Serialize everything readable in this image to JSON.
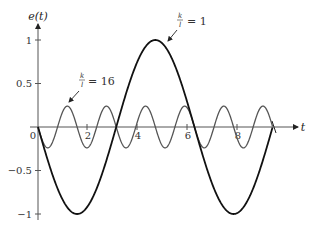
{
  "chart_data": {
    "type": "line",
    "title": "",
    "xlabel": "t",
    "ylabel": "e(t)",
    "xlim": [
      0,
      9.42
    ],
    "ylim": [
      -1.05,
      1.1
    ],
    "x_ticks": [
      0,
      2,
      4,
      6,
      8
    ],
    "x_tick_labels": [
      "0",
      "2",
      "4",
      "6",
      "8"
    ],
    "y_ticks": [
      1,
      0.5,
      -0.5,
      -1
    ],
    "y_tick_labels": [
      "1",
      "0.5",
      "−0.5",
      "−1"
    ],
    "grid": false,
    "legend": "none (inline annotations with arrows)",
    "series": [
      {
        "name": "k/l = 1",
        "formula": "e(t) = -sin(t)",
        "amplitude": 1.0,
        "period": 6.283,
        "color": "#111111",
        "x": [
          0,
          1.571,
          3.142,
          4.712,
          6.283,
          7.854,
          9.425
        ],
        "values": [
          0,
          -1,
          0,
          1,
          0,
          -1,
          0
        ]
      },
      {
        "name": "k/l = 16",
        "formula": "e(t) = -0.24 sin(4t)",
        "amplitude": 0.24,
        "period": 1.571,
        "color": "#555555",
        "x": [
          0,
          0.393,
          0.785,
          1.178,
          1.571,
          1.963,
          2.356,
          2.749,
          3.142
        ],
        "values": [
          0,
          -0.24,
          0,
          0.24,
          0,
          -0.24,
          0,
          0.24,
          0
        ]
      }
    ],
    "annotations": [
      {
        "fraction_num": "k",
        "fraction_den": "l",
        "text": "= 1",
        "points_to": "k/l = 1 curve near its peak"
      },
      {
        "fraction_num": "k",
        "fraction_den": "l",
        "text": "= 16",
        "points_to": "k/l = 16 curve first peak"
      }
    ]
  }
}
